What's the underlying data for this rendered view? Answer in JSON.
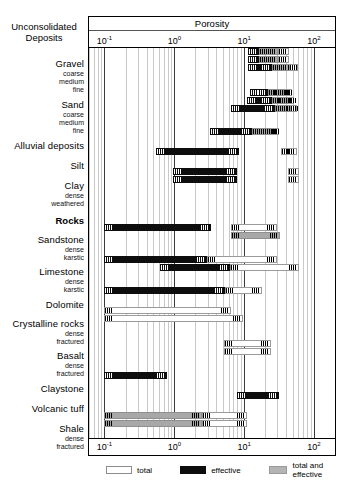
{
  "chart_data": {
    "type": "bar",
    "title": "Porosity",
    "xlabel": "Porosity",
    "ylabel": "",
    "scale": "log",
    "xlim": [
      0.06,
      200
    ],
    "grid": true,
    "tick_labels": [
      "10⁻¹",
      "10⁰",
      "10¹",
      "10²"
    ],
    "tick_values": [
      0.1,
      1,
      10,
      100
    ],
    "tick_exponents": [
      "-1",
      "0",
      "1",
      "2"
    ],
    "legend_position": "bottom",
    "legend": [
      {
        "key": "total",
        "label": "total",
        "color": "#ffffff"
      },
      {
        "key": "effective",
        "label": "effective",
        "color": "#0d0d0d"
      },
      {
        "key": "both",
        "label": "total and effective",
        "color": "#a8a8a8"
      }
    ],
    "group_headers": [
      {
        "label": "Unconsolidated Deposits",
        "bold": false
      },
      {
        "label": "Rocks",
        "bold": true
      }
    ],
    "categories": [
      {
        "name": "Gravel",
        "sub": "coarse",
        "series": [
          {
            "type": "effective",
            "range": [
              11.5,
              16.5
            ]
          },
          {
            "type": "both",
            "range": [
              16.5,
              31
            ]
          },
          {
            "type": "total",
            "range": [
              31,
              44
            ]
          }
        ]
      },
      {
        "name": "Gravel",
        "sub": "medium",
        "series": [
          {
            "type": "effective",
            "range": [
              11.5,
              16.5
            ]
          },
          {
            "type": "both",
            "range": [
              16.5,
              31
            ]
          },
          {
            "type": "total",
            "range": [
              31,
              44
            ]
          }
        ]
      },
      {
        "name": "Gravel",
        "sub": "fine",
        "series": [
          {
            "type": "effective",
            "range": [
              11.5,
              25
            ]
          },
          {
            "type": "both",
            "range": [
              25,
              44
            ]
          },
          {
            "type": "total",
            "range": [
              44,
              60
            ]
          }
        ]
      },
      {
        "name": "Sand",
        "sub": "coarse",
        "series": [
          {
            "type": "effective",
            "range": [
              12,
              22
            ]
          },
          {
            "type": "both",
            "range": [
              22,
              37
            ]
          },
          {
            "type": "total",
            "range": [
              37,
              48
            ]
          }
        ]
      },
      {
        "name": "Sand",
        "sub": "medium",
        "series": [
          {
            "type": "effective",
            "range": [
              11,
              25
            ]
          },
          {
            "type": "both",
            "range": [
              25,
              42
            ]
          },
          {
            "type": "total",
            "range": [
              42,
              52
            ]
          }
        ]
      },
      {
        "name": "Sand",
        "sub": "fine",
        "series": [
          {
            "type": "effective",
            "range": [
              6.5,
              28
            ]
          },
          {
            "type": "both",
            "range": [
              28,
              45
            ]
          },
          {
            "type": "total",
            "range": [
              45,
              58
            ]
          }
        ]
      },
      {
        "name": "Alluvial deposits",
        "sub": "",
        "series": [
          {
            "type": "effective",
            "range": [
              3.2,
              13
            ]
          },
          {
            "type": "both",
            "range": [
              13,
              24
            ]
          },
          {
            "type": "total",
            "range": [
              24,
              32
            ]
          }
        ]
      },
      {
        "name": "Silt",
        "sub": "",
        "series": [
          {
            "type": "effective",
            "range": [
              0.55,
              8.5
            ]
          },
          {
            "type": "total",
            "range": [
              34,
              58
            ]
          }
        ]
      },
      {
        "name": "Clay",
        "sub": "dense",
        "series": [
          {
            "type": "effective",
            "range": [
              0.95,
              8.0
            ]
          },
          {
            "type": "total",
            "range": [
              42,
              62
            ]
          }
        ]
      },
      {
        "name": "Clay",
        "sub": "weathered",
        "series": [
          {
            "type": "effective",
            "range": [
              0.95,
              8.0
            ]
          },
          {
            "type": "total",
            "range": [
              42,
              62
            ]
          }
        ]
      },
      {
        "name": "Sandstone",
        "sub": "dense",
        "series": [
          {
            "type": "effective",
            "range": [
              0.1,
              3.3
            ]
          },
          {
            "type": "total",
            "range": [
              6.5,
              30
            ]
          }
        ]
      },
      {
        "name": "Sandstone",
        "sub": "karstic",
        "series": [
          {
            "type": "both",
            "range": [
              6.5,
              33
            ]
          }
        ]
      },
      {
        "name": "Limestone",
        "sub": "dense",
        "series": [
          {
            "type": "effective",
            "range": [
              0.1,
              2.9
            ]
          },
          {
            "type": "total",
            "range": [
              2.9,
              30
            ]
          }
        ]
      },
      {
        "name": "Limestone",
        "sub": "karstic",
        "series": [
          {
            "type": "effective",
            "range": [
              0.62,
              6.2
            ]
          },
          {
            "type": "total",
            "range": [
              6.2,
              62
            ]
          }
        ]
      },
      {
        "name": "Dolomite",
        "sub": "",
        "series": [
          {
            "type": "effective",
            "range": [
              0.1,
              5.3
            ]
          },
          {
            "type": "total",
            "range": [
              5.3,
              18
            ]
          }
        ]
      },
      {
        "name": "Crystalline rocks",
        "sub": "dense",
        "series": [
          {
            "type": "total",
            "range": [
              0.1,
              6.5
            ]
          }
        ]
      },
      {
        "name": "Crystalline rocks",
        "sub": "fractured",
        "series": [
          {
            "type": "total",
            "range": [
              0.1,
              9.5
            ]
          }
        ]
      },
      {
        "name": "Basalt",
        "sub": "dense",
        "series": [
          {
            "type": "total",
            "range": [
              5.2,
              24
            ]
          }
        ]
      },
      {
        "name": "Basalt",
        "sub": "fractured",
        "series": [
          {
            "type": "total",
            "range": [
              5.2,
              24
            ]
          }
        ]
      },
      {
        "name": "Claystone",
        "sub": "",
        "series": [
          {
            "type": "effective",
            "range": [
              0.1,
              0.78
            ]
          }
        ]
      },
      {
        "name": "Volcanic tuff",
        "sub": "",
        "series": [
          {
            "type": "effective",
            "range": [
              8.0,
              32
            ]
          }
        ]
      },
      {
        "name": "Shale",
        "sub": "dense",
        "series": [
          {
            "type": "both",
            "range": [
              0.1,
              2.5
            ]
          },
          {
            "type": "total",
            "range": [
              2.5,
              11
            ]
          }
        ]
      },
      {
        "name": "Shale",
        "sub": "fractured",
        "series": [
          {
            "type": "both",
            "range": [
              0.1,
              2.5
            ]
          },
          {
            "type": "total",
            "range": [
              2.5,
              11
            ]
          }
        ]
      }
    ]
  },
  "header": {
    "unconsolidated": "Unconsolidated",
    "deposits": "Deposits",
    "rocks": "Rocks"
  },
  "axis": {
    "title": "Porosity",
    "t1_mantissa": "10",
    "t1_exp": "-1",
    "t2_mantissa": "10",
    "t2_exp": "0",
    "t3_mantissa": "10",
    "t3_exp": "1",
    "t4_mantissa": "10",
    "t4_exp": "2"
  },
  "labels": {
    "gravel": "Gravel",
    "gravel_coarse": "coarse",
    "gravel_medium": "medium",
    "gravel_fine": "fine",
    "sand": "Sand",
    "sand_coarse": "coarse",
    "sand_medium": "medium",
    "sand_fine": "fine",
    "alluvial": "Alluvial deposits",
    "silt": "Silt",
    "clay": "Clay",
    "clay_dense": "dense",
    "clay_weathered": "weathered",
    "sandstone": "Sandstone",
    "sandstone_dense": "dense",
    "sandstone_karstic": "karstic",
    "limestone": "Limestone",
    "limestone_dense": "dense",
    "limestone_karstic": "karstic",
    "dolomite": "Dolomite",
    "crystalline": "Crystalline rocks",
    "crystalline_dense": "dense",
    "crystalline_fractured": "fractured",
    "basalt": "Basalt",
    "basalt_dense": "dense",
    "basalt_fractured": "fractured",
    "claystone": "Claystone",
    "volcanic": "Volcanic tuff",
    "shale": "Shale",
    "shale_dense": "dense",
    "shale_fractured": "fractured"
  },
  "legend": {
    "total": "total",
    "effective": "effective",
    "both": "total and effective"
  }
}
